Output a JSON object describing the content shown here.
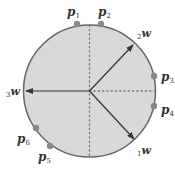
{
  "diagram": {
    "circle": {
      "cx": 89.5,
      "cy": 91,
      "r": 66,
      "fill": "#d9d9d9",
      "stroke": "#666666"
    },
    "points": [
      {
        "id": "p1",
        "letter": "p",
        "sub": "1",
        "x": 77,
        "y": 24,
        "lx": 67,
        "ly": 16
      },
      {
        "id": "p2",
        "letter": "p",
        "sub": "2",
        "x": 101,
        "y": 24,
        "lx": 98,
        "ly": 16
      },
      {
        "id": "p3",
        "letter": "p",
        "sub": "3",
        "x": 154,
        "y": 76,
        "lx": 161,
        "ly": 81
      },
      {
        "id": "p4",
        "letter": "p",
        "sub": "4",
        "x": 154,
        "y": 106,
        "lx": 161,
        "ly": 114
      },
      {
        "id": "p5",
        "letter": "p",
        "sub": "5",
        "x": 50,
        "y": 146,
        "lx": 38,
        "ly": 161
      },
      {
        "id": "p6",
        "letter": "p",
        "sub": "6",
        "x": 36,
        "y": 128,
        "lx": 17,
        "ly": 143
      }
    ],
    "vectors": [
      {
        "id": "1w",
        "prefix": "1",
        "letter": "w",
        "x2": 134,
        "y2": 139,
        "lx": 137,
        "ly": 154
      },
      {
        "id": "2w",
        "prefix": "2",
        "letter": "w",
        "x2": 133,
        "y2": 45,
        "lx": 137,
        "ly": 37
      },
      {
        "id": "3w",
        "prefix": "3",
        "letter": "w",
        "x2": 26,
        "y2": 91,
        "lx": 6,
        "ly": 95
      }
    ],
    "dotted_lines": [
      {
        "id": "vertical-axis",
        "x1": 89.5,
        "y1": 25,
        "x2": 89.5,
        "y2": 157
      },
      {
        "id": "horizontal-half-axis",
        "x1": 89.5,
        "y1": 91,
        "x2": 154,
        "y2": 91
      }
    ],
    "colors": {
      "dot": "#888888",
      "line": "#333333",
      "dotted": "#777777"
    }
  }
}
